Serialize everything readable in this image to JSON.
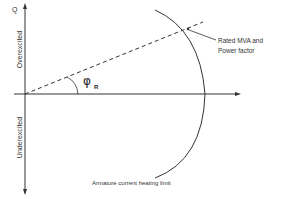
{
  "diagram": {
    "axis_label_q": "Q",
    "region_over": "Overexcited",
    "region_under": "Underexcited",
    "angle_symbol": "φ",
    "angle_subscript": "R",
    "annotation_rated": [
      "Rated MVA and",
      "Power factor"
    ],
    "curve_label": "Armature current heating limit",
    "colors": {
      "line": "#333333",
      "background": "#ffffff"
    }
  }
}
